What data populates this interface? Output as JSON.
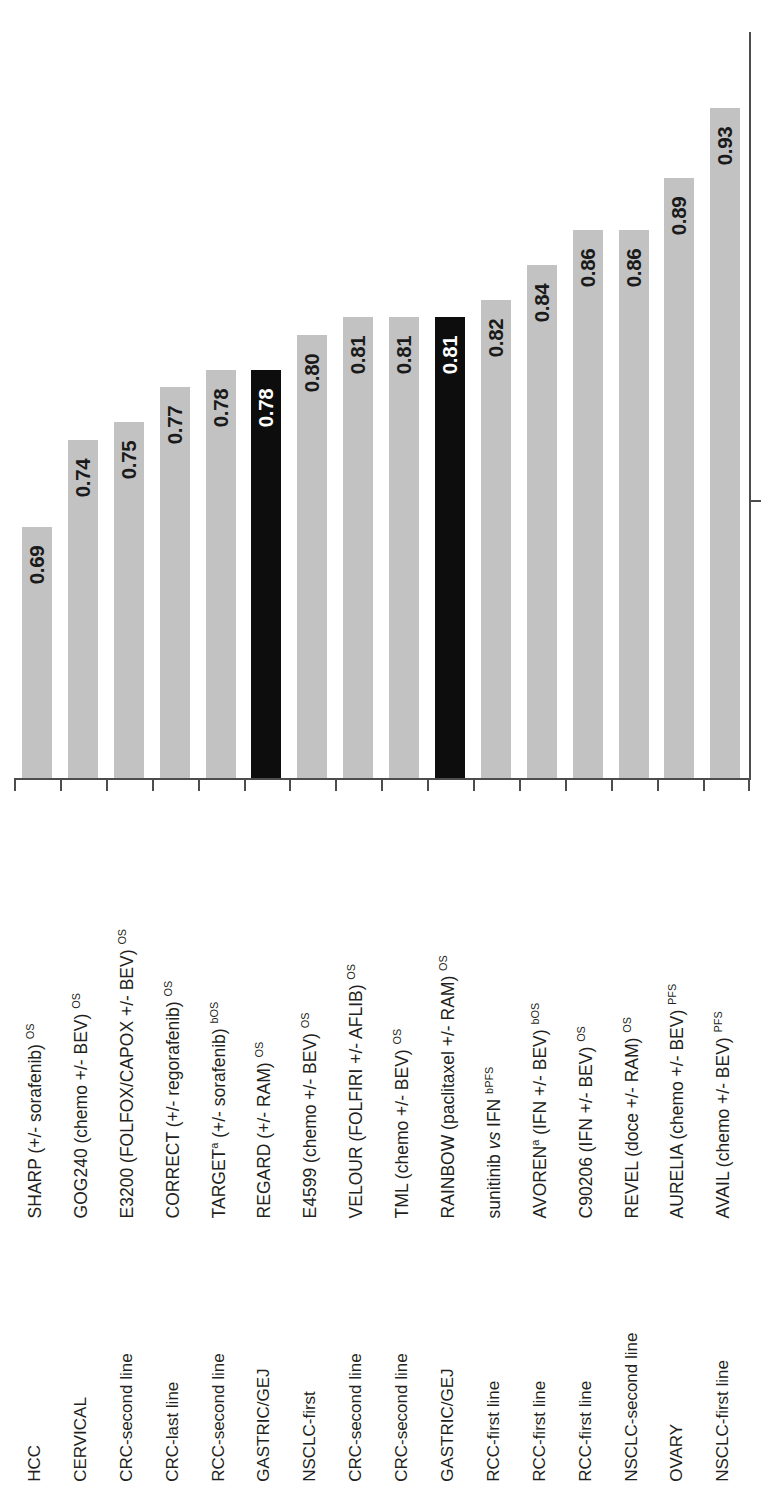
{
  "chart_data": {
    "type": "bar",
    "title": "",
    "subtitle": "",
    "xlabel": "",
    "ylabel": "",
    "ylim": [
      0.6,
      0.97
    ],
    "grid": false,
    "legend_position": "none",
    "orientation": "vertical-bars-rotated-labels",
    "categories": [
      "SHARP (+/- sorafenib) OS",
      "GOG240 (chemo +/- BEV) OS",
      "E3200 (FOLFOX/CAPOX +/- BEV) OS",
      "CORRECT (+/- regorafenib) OS",
      "TARGET a (+/- sorafenib) b OS",
      "REGARD (+/- RAM) OS",
      "E4599 (chemo +/- BEV) OS",
      "VELOUR (FOLFIRI +/- AFLIB) OS",
      "TML (chemo +/- BEV) OS",
      "RAINBOW (paclitaxel +/- RAM) OS",
      "sunitinib vs IFN b PFS",
      "AVOREN a (IFN +/- BEV) b OS",
      "C90206 (IFN +/- BEV) OS",
      "REVEL (doce +/- RAM) OS",
      "AURELIA (chemo +/- BEV) PFS",
      "AVAIL (chemo +/- BEV) PFS"
    ],
    "values": [
      0.69,
      0.74,
      0.75,
      0.77,
      0.78,
      0.78,
      0.8,
      0.81,
      0.81,
      0.81,
      0.82,
      0.84,
      0.86,
      0.86,
      0.89,
      0.93
    ],
    "tumor_types": [
      "HCC",
      "CERVICAL",
      "CRC-second line",
      "CRC-last line",
      "RCC-second line",
      "GASTRIC/GEJ",
      "NSCLC-first",
      "CRC-second line",
      "CRC-second line",
      "GASTRIC/GEJ",
      "RCC-first line",
      "RCC-first line",
      "RCC-first line",
      "NSCLC-second line",
      "OVARY",
      "NSCLC-first line"
    ],
    "highlighted_indices": [
      5,
      9
    ],
    "colors": {
      "bar_default": "#c2c2c2",
      "bar_highlight": "#0d0d0d",
      "value_label_default": "#1a1a1a",
      "value_label_highlight": "#ffffff",
      "axis": "#4d4d4d",
      "text": "#231f20",
      "background": "#ffffff"
    }
  },
  "bars": [
    {
      "value_label": "0.69",
      "value": 0.69,
      "highlight": false,
      "trial": {
        "main": "SHARP (+/- sorafenib)",
        "sup": "OS",
        "pre_sup": "",
        "italic_word": ""
      },
      "tumor": "HCC"
    },
    {
      "value_label": "0.74",
      "value": 0.74,
      "highlight": false,
      "trial": {
        "main": "GOG240 (chemo +/- BEV)",
        "sup": "OS",
        "pre_sup": "",
        "italic_word": ""
      },
      "tumor": "CERVICAL"
    },
    {
      "value_label": "0.75",
      "value": 0.75,
      "highlight": false,
      "trial": {
        "main": "E3200 (FOLFOX/CAPOX +/- BEV)",
        "sup": "OS",
        "pre_sup": "",
        "italic_word": ""
      },
      "tumor": "CRC-second line"
    },
    {
      "value_label": "0.77",
      "value": 0.77,
      "highlight": false,
      "trial": {
        "main": "CORRECT (+/- regorafenib)",
        "sup": "OS",
        "pre_sup": "",
        "italic_word": ""
      },
      "tumor": "CRC-last line"
    },
    {
      "value_label": "0.78",
      "value": 0.78,
      "highlight": false,
      "trial": {
        "main": "TARGET",
        "sup": "bOS",
        "pre_sup": "a",
        "mid": " (+/- sorafenib) ",
        "italic_word": ""
      },
      "tumor": "RCC-second line"
    },
    {
      "value_label": "0.78",
      "value": 0.78,
      "highlight": true,
      "trial": {
        "main": "REGARD (+/- RAM)",
        "sup": "OS",
        "pre_sup": "",
        "italic_word": ""
      },
      "tumor": "GASTRIC/GEJ"
    },
    {
      "value_label": "0.80",
      "value": 0.8,
      "highlight": false,
      "trial": {
        "main": "E4599 (chemo +/- BEV)",
        "sup": "OS",
        "pre_sup": "",
        "italic_word": ""
      },
      "tumor": "NSCLC-first"
    },
    {
      "value_label": "0.81",
      "value": 0.81,
      "highlight": false,
      "trial": {
        "main": "VELOUR (FOLFIRI +/- AFLIB)",
        "sup": "OS",
        "pre_sup": "",
        "italic_word": ""
      },
      "tumor": "CRC-second line"
    },
    {
      "value_label": "0.81",
      "value": 0.81,
      "highlight": false,
      "trial": {
        "main": "TML (chemo +/- BEV)",
        "sup": "OS",
        "pre_sup": "",
        "italic_word": ""
      },
      "tumor": "CRC-second line"
    },
    {
      "value_label": "0.81",
      "value": 0.81,
      "highlight": true,
      "trial": {
        "main": "RAINBOW (paclitaxel +/- RAM)",
        "sup": "OS",
        "pre_sup": "",
        "italic_word": ""
      },
      "tumor": "GASTRIC/GEJ"
    },
    {
      "value_label": "0.82",
      "value": 0.82,
      "highlight": false,
      "trial": {
        "main": "sunitinib",
        "sup": "bPFS",
        "pre_sup": "",
        "mid": " IFN ",
        "italic_word": "vs"
      },
      "tumor": "RCC-first line"
    },
    {
      "value_label": "0.84",
      "value": 0.84,
      "highlight": false,
      "trial": {
        "main": "AVOREN",
        "sup": "bOS",
        "pre_sup": "a",
        "mid": " (IFN +/- BEV) ",
        "italic_word": ""
      },
      "tumor": "RCC-first line"
    },
    {
      "value_label": "0.86",
      "value": 0.86,
      "highlight": false,
      "trial": {
        "main": "C90206 (IFN +/- BEV)",
        "sup": "OS",
        "pre_sup": "",
        "italic_word": ""
      },
      "tumor": "RCC-first line"
    },
    {
      "value_label": "0.86",
      "value": 0.86,
      "highlight": false,
      "trial": {
        "main": "REVEL (doce +/- RAM)",
        "sup": "OS",
        "pre_sup": "",
        "italic_word": ""
      },
      "tumor": "NSCLC-second line"
    },
    {
      "value_label": "0.89",
      "value": 0.89,
      "highlight": false,
      "trial": {
        "main": "AURELIA (chemo +/- BEV)",
        "sup": "PFS",
        "pre_sup": "",
        "italic_word": ""
      },
      "tumor": "OVARY"
    },
    {
      "value_label": "0.93",
      "value": 0.93,
      "highlight": false,
      "trial": {
        "main": "AVAIL (chemo +/- BEV)",
        "sup": "PFS",
        "pre_sup": "",
        "italic_word": ""
      },
      "tumor": "NSCLC-first line"
    }
  ]
}
